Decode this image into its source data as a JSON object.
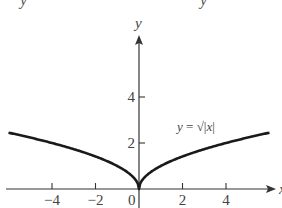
{
  "chart_data": {
    "type": "line",
    "title": "",
    "function_label": "y = √|x|",
    "function_label_parts": {
      "lhs": "y",
      "eq": " = ",
      "root": "√",
      "abs_open": "|",
      "var": "x",
      "abs_close": "|"
    },
    "xlabel": "x",
    "ylabel": "y",
    "xlim": [
      -6.4,
      6.3
    ],
    "ylim": [
      -0.8,
      6.8
    ],
    "x_ticks": [
      -4,
      -2,
      0,
      2,
      4
    ],
    "x_tick_labels": [
      "−4",
      "−2",
      "0",
      "2",
      "4"
    ],
    "y_ticks": [
      2,
      4
    ],
    "y_tick_labels": [
      "2",
      "4"
    ],
    "grid": false,
    "legend": "none",
    "series": [
      {
        "name": "y = √|x|",
        "x": [
          -6,
          -5,
          -4,
          -3,
          -2,
          -1,
          -0.5,
          -0.1,
          0,
          0.1,
          0.5,
          1,
          2,
          3,
          4,
          5,
          6
        ],
        "y": [
          2.449,
          2.236,
          2.0,
          1.732,
          1.414,
          1.0,
          0.707,
          0.316,
          0,
          0.316,
          0.707,
          1.0,
          1.414,
          1.732,
          2.0,
          2.236,
          2.449
        ]
      }
    ]
  },
  "top_fragments": [
    "y",
    "y"
  ]
}
